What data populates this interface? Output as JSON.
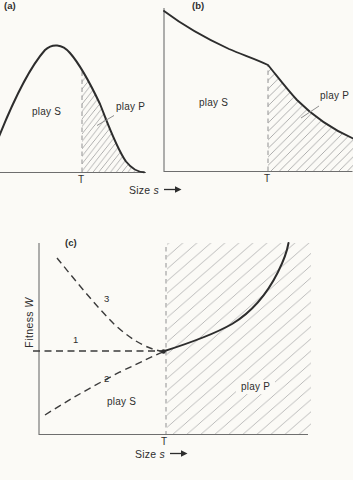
{
  "figure": {
    "background": "#fbfaf6",
    "ink_color": "#2d2d2d",
    "axis_color": "#6e6e6e",
    "hatch_color": "#a9a9a9",
    "panels": {
      "a": {
        "tag": "(a)",
        "play_s": "play S",
        "play_p": "play P",
        "threshold": "T"
      },
      "b": {
        "tag": "(b)",
        "play_s": "play S",
        "play_p": "play P",
        "threshold": "T"
      },
      "c": {
        "tag": "(c)",
        "play_s": "play S",
        "play_p": "play P",
        "threshold": "T",
        "curve_label_1": "1",
        "curve_label_2": "2",
        "curve_label_3": "3",
        "y_axis_word": "Fitness",
        "y_axis_variable": "W"
      }
    },
    "x_axis_top": {
      "word": "Size",
      "variable": "s",
      "arrow": "→"
    },
    "x_axis_bottom": {
      "word": "Size",
      "variable": "s",
      "arrow": "→"
    }
  }
}
